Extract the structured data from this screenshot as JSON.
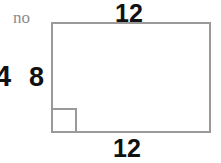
{
  "figure": {
    "type": "geometry-diagram",
    "shape": "rectangle",
    "background_color": "#ffffff",
    "stroke_color": "#9a9a9a",
    "text_color": "#111111",
    "note_color": "#8c8c8c"
  },
  "labels": {
    "top": "12",
    "bottom": "12",
    "left_inner": "8",
    "left_outer": "4",
    "note": "no"
  },
  "chart_data": {
    "type": "table",
    "title": "",
    "categories": [
      "top side",
      "bottom side",
      "left side",
      "left outer label"
    ],
    "values": [
      12,
      12,
      8,
      4
    ],
    "annotations": [
      "no",
      "right-angle marker at bottom-left corner"
    ]
  }
}
